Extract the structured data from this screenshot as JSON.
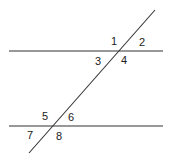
{
  "diagram": {
    "type": "parallel-lines-transversal",
    "colors": {
      "line": "#333333",
      "label": "#222222",
      "background": "#ffffff"
    },
    "lines": {
      "top": {
        "x1": 9,
        "y1": 51,
        "x2": 163,
        "y2": 51
      },
      "bottom": {
        "x1": 9,
        "y1": 126,
        "x2": 163,
        "y2": 126
      },
      "transversal": {
        "x1": 155,
        "y1": 10,
        "x2": 29,
        "y2": 153
      }
    },
    "angles": [
      {
        "label": "1",
        "x": 111,
        "y": 45
      },
      {
        "label": "2",
        "x": 139,
        "y": 46
      },
      {
        "label": "3",
        "x": 95,
        "y": 65
      },
      {
        "label": "4",
        "x": 121,
        "y": 64
      },
      {
        "label": "5",
        "x": 42,
        "y": 120
      },
      {
        "label": "6",
        "x": 68,
        "y": 121
      },
      {
        "label": "7",
        "x": 27,
        "y": 139
      },
      {
        "label": "8",
        "x": 56,
        "y": 140
      }
    ]
  }
}
